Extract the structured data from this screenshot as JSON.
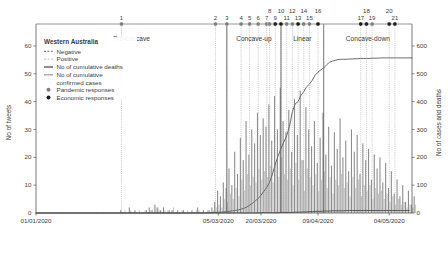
{
  "chart_data": {
    "type": "bar",
    "title": "",
    "subtitle": "",
    "xlabel": "",
    "ylabel": "No of tweets",
    "y2label": "No of cases and deaths",
    "ylim": [
      0,
      65
    ],
    "y2lim": [
      0,
      650
    ],
    "yticks": [
      10,
      20,
      30,
      40,
      50,
      60
    ],
    "y2ticks": [
      0,
      100,
      200,
      300,
      400,
      500,
      600
    ],
    "y_zero_label": "0",
    "y2_zero_label": "0",
    "grid": false,
    "legend_position": "top-left",
    "xticklabels": [
      "01/01/2020",
      "05/03/2020",
      "20/03/2020",
      "09/04/2020",
      "04/05/2020"
    ],
    "xtick_positions": [
      0,
      64,
      79,
      99,
      124
    ],
    "x_days_total": 132,
    "series": [
      {
        "name": "Negative",
        "type": "bar",
        "color": "#8c8c8c",
        "axis": "left",
        "values": [
          0,
          0,
          0,
          0,
          0,
          0,
          0,
          0,
          0,
          0,
          0,
          0,
          0,
          0,
          0,
          0,
          0,
          0,
          0,
          0,
          0,
          0,
          0,
          0,
          0,
          0,
          0,
          0,
          0,
          0,
          1,
          0,
          0,
          2,
          0,
          1,
          0,
          0,
          0,
          1,
          2,
          1,
          3,
          2,
          1,
          2,
          0,
          1,
          1,
          0,
          1,
          0,
          1,
          0,
          0,
          1,
          0,
          2,
          0,
          1,
          0,
          1,
          2,
          4,
          8,
          6,
          11,
          9,
          16,
          10,
          22,
          14,
          27,
          19,
          33,
          21,
          30,
          25,
          36,
          28,
          34,
          31,
          39,
          26,
          42,
          30,
          45,
          33,
          29,
          37,
          22,
          41,
          28,
          44,
          19,
          38,
          30,
          24,
          33,
          18,
          27,
          36,
          21,
          31,
          17,
          29,
          23,
          34,
          20,
          26,
          15,
          30,
          22,
          28,
          14,
          25,
          19,
          23,
          12,
          21,
          16,
          20,
          11,
          18,
          9,
          15,
          7,
          12,
          6,
          10,
          4,
          8,
          3,
          6
        ],
        "peak": 45
      },
      {
        "name": "Positive",
        "type": "bar",
        "color": "#c9c9c9",
        "axis": "left",
        "values": [
          0,
          0,
          0,
          0,
          0,
          0,
          0,
          0,
          0,
          0,
          0,
          0,
          0,
          0,
          0,
          0,
          0,
          0,
          0,
          0,
          0,
          0,
          0,
          0,
          0,
          0,
          0,
          0,
          0,
          0,
          0,
          1,
          0,
          1,
          0,
          0,
          1,
          0,
          1,
          0,
          1,
          0,
          2,
          1,
          0,
          1,
          1,
          0,
          2,
          0,
          0,
          1,
          0,
          1,
          0,
          0,
          1,
          1,
          0,
          0,
          1,
          0,
          1,
          2,
          3,
          2,
          5,
          4,
          7,
          5,
          9,
          6,
          12,
          8,
          14,
          10,
          13,
          11,
          16,
          12,
          15,
          13,
          17,
          11,
          18,
          13,
          20,
          14,
          12,
          16,
          10,
          18,
          12,
          19,
          8,
          16,
          13,
          10,
          14,
          8,
          12,
          15,
          9,
          13,
          7,
          12,
          10,
          14,
          9,
          11,
          6,
          13,
          9,
          12,
          6,
          10,
          8,
          10,
          5,
          9,
          7,
          8,
          5,
          7,
          4,
          6,
          3,
          5,
          3,
          4,
          2,
          3,
          2,
          3
        ],
        "peak": 20
      },
      {
        "name": "No of cumulative confirmed cases",
        "type": "line",
        "color": "#6b6b6b",
        "axis": "right",
        "values": [
          0,
          0,
          0,
          0,
          0,
          0,
          0,
          0,
          0,
          0,
          0,
          0,
          0,
          0,
          0,
          0,
          0,
          0,
          0,
          0,
          0,
          0,
          0,
          0,
          0,
          0,
          0,
          0,
          0,
          0,
          0,
          0,
          0,
          0,
          0,
          0,
          0,
          0,
          0,
          0,
          0,
          0,
          0,
          0,
          0,
          0,
          0,
          0,
          0,
          0,
          0,
          0,
          0,
          0,
          0,
          0,
          0,
          0,
          0,
          0,
          1,
          1,
          2,
          2,
          3,
          3,
          4,
          5,
          6,
          8,
          9,
          11,
          14,
          17,
          21,
          28,
          35,
          44,
          52,
          64,
          78,
          92,
          110,
          140,
          175,
          205,
          231,
          255,
          278,
          311,
          364,
          392,
          400,
          422,
          436,
          453,
          463,
          477,
          495,
          506,
          514,
          521,
          532,
          541,
          545,
          548,
          551,
          552,
          552,
          552,
          553,
          553,
          554,
          554,
          555,
          555,
          555,
          555,
          556,
          556,
          556,
          557,
          557,
          557,
          557,
          557,
          557,
          557,
          557,
          557,
          557,
          557,
          557
        ],
        "plateau_value": 557
      },
      {
        "name": "No of cumulative deaths",
        "type": "line",
        "color": "#4a4a4a",
        "axis": "right",
        "values": [
          0,
          0,
          0,
          0,
          0,
          0,
          0,
          0,
          0,
          0,
          0,
          0,
          0,
          0,
          0,
          0,
          0,
          0,
          0,
          0,
          0,
          0,
          0,
          0,
          0,
          0,
          0,
          0,
          0,
          0,
          0,
          0,
          0,
          0,
          0,
          0,
          0,
          0,
          0,
          0,
          0,
          0,
          0,
          0,
          0,
          0,
          0,
          0,
          0,
          0,
          0,
          0,
          0,
          0,
          0,
          0,
          0,
          0,
          0,
          0,
          0,
          0,
          0,
          0,
          0,
          0,
          0,
          0,
          0,
          0,
          0,
          0,
          0,
          0,
          0,
          0,
          0,
          0,
          0,
          1,
          1,
          1,
          1,
          1,
          1,
          1,
          2,
          2,
          2,
          2,
          2,
          3,
          3,
          3,
          4,
          4,
          5,
          5,
          6,
          6,
          6,
          7,
          7,
          7,
          8,
          8,
          8,
          8,
          8,
          9,
          9,
          9,
          9,
          9,
          9,
          9,
          9,
          9,
          9,
          9,
          9,
          9,
          9,
          9,
          9,
          9,
          9,
          9,
          9,
          9,
          9,
          9
        ],
        "final_value": 9
      }
    ],
    "phases": [
      {
        "label": "Pre-concave",
        "start_day": 0,
        "end_day": 67
      },
      {
        "label": "Concave-up",
        "start_day": 67,
        "end_day": 86
      },
      {
        "label": "Linear",
        "start_day": 86,
        "end_day": 101
      },
      {
        "label": "Concave-down",
        "start_day": 101,
        "end_day": 132
      }
    ],
    "response_markers": [
      {
        "num": "1",
        "day": 30,
        "kind": "pandemic"
      },
      {
        "num": "2",
        "day": 63,
        "kind": "pandemic"
      },
      {
        "num": "3",
        "day": 67,
        "kind": "pandemic"
      },
      {
        "num": "4",
        "day": 72,
        "kind": "pandemic"
      },
      {
        "num": "5",
        "day": 75,
        "kind": "pandemic"
      },
      {
        "num": "6",
        "day": 78,
        "kind": "pandemic"
      },
      {
        "num": "7",
        "day": 81,
        "kind": "pandemic"
      },
      {
        "num": "8",
        "day": 82,
        "kind": "pandemic"
      },
      {
        "num": "9",
        "day": 84,
        "kind": "economic"
      },
      {
        "num": "10",
        "day": 86,
        "kind": "economic"
      },
      {
        "num": "11",
        "day": 88,
        "kind": "pandemic"
      },
      {
        "num": "12",
        "day": 90,
        "kind": "pandemic"
      },
      {
        "num": "13",
        "day": 92,
        "kind": "economic"
      },
      {
        "num": "14",
        "day": 94,
        "kind": "pandemic"
      },
      {
        "num": "15",
        "day": 96,
        "kind": "pandemic"
      },
      {
        "num": "16",
        "day": 99,
        "kind": "economic"
      },
      {
        "num": "17",
        "day": 114,
        "kind": "economic"
      },
      {
        "num": "18",
        "day": 116,
        "kind": "economic"
      },
      {
        "num": "19",
        "day": 118,
        "kind": "pandemic"
      },
      {
        "num": "20",
        "day": 124,
        "kind": "economic"
      },
      {
        "num": "21",
        "day": 126,
        "kind": "economic"
      }
    ],
    "colors": {
      "negative_bar": "#8c8c8c",
      "positive_bar": "#c9c9c9",
      "cumulative_deaths": "#4a4a4a",
      "cumulative_cases": "#6b6b6b",
      "pandemic_marker": "#7d7d7d",
      "economic_marker": "#1c1c1c",
      "axis": "#555555",
      "text": "#3b3b3b",
      "phase_divider": "#4f4f4f",
      "marker_guide": "#9a9a9a"
    }
  },
  "legend": {
    "title": "Western Australia",
    "items": [
      {
        "label": "Negative",
        "glyph": "line",
        "color": "#8c8c8c",
        "dash": "2 1.4"
      },
      {
        "label": "Positive",
        "glyph": "line",
        "color": "#c9c9c9",
        "dash": "2 1.4"
      },
      {
        "label": "No of cumulative deaths",
        "glyph": "line",
        "color": "#4a4a4a",
        "dash": "none"
      },
      {
        "label": "No of cumulative",
        "glyph": "line",
        "color": "#9d9d9d",
        "dash": "none"
      },
      {
        "label": "confirmed cases",
        "glyph": "none",
        "color": "#9d9d9d",
        "dash": "none"
      },
      {
        "label": "Pandemic responses",
        "glyph": "circle",
        "color": "#7d7d7d",
        "dash": "none"
      },
      {
        "label": "Economic responses",
        "glyph": "circle",
        "color": "#1c1c1c",
        "dash": "none"
      }
    ]
  }
}
